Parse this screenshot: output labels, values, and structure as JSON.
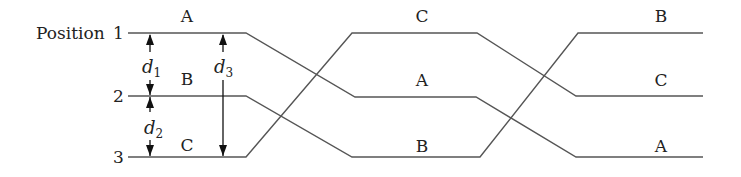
{
  "diagram": {
    "axis_label": "Position",
    "positions": [
      {
        "number": "1",
        "y": 33
      },
      {
        "number": "2",
        "y": 96
      },
      {
        "number": "3",
        "y": 157
      }
    ],
    "stages": [
      {
        "labels": {
          "top": "A",
          "middle": "B",
          "bottom": "C"
        },
        "x": 187
      },
      {
        "labels": {
          "top": "C",
          "middle": "A",
          "bottom": "B"
        },
        "x": 422
      },
      {
        "labels": {
          "top": "B",
          "middle": "C",
          "bottom": "A"
        },
        "x": 657
      }
    ],
    "dimensions": {
      "d1": {
        "symbol": "d",
        "subscript": "1",
        "from": "1",
        "to": "2"
      },
      "d2": {
        "symbol": "d",
        "subscript": "2",
        "from": "2",
        "to": "3"
      },
      "d3": {
        "symbol": "d",
        "subscript": "3",
        "from": "1",
        "to": "3"
      }
    },
    "colors": {
      "line": "#555555",
      "arrow": "#111111",
      "text": "#222222"
    }
  }
}
